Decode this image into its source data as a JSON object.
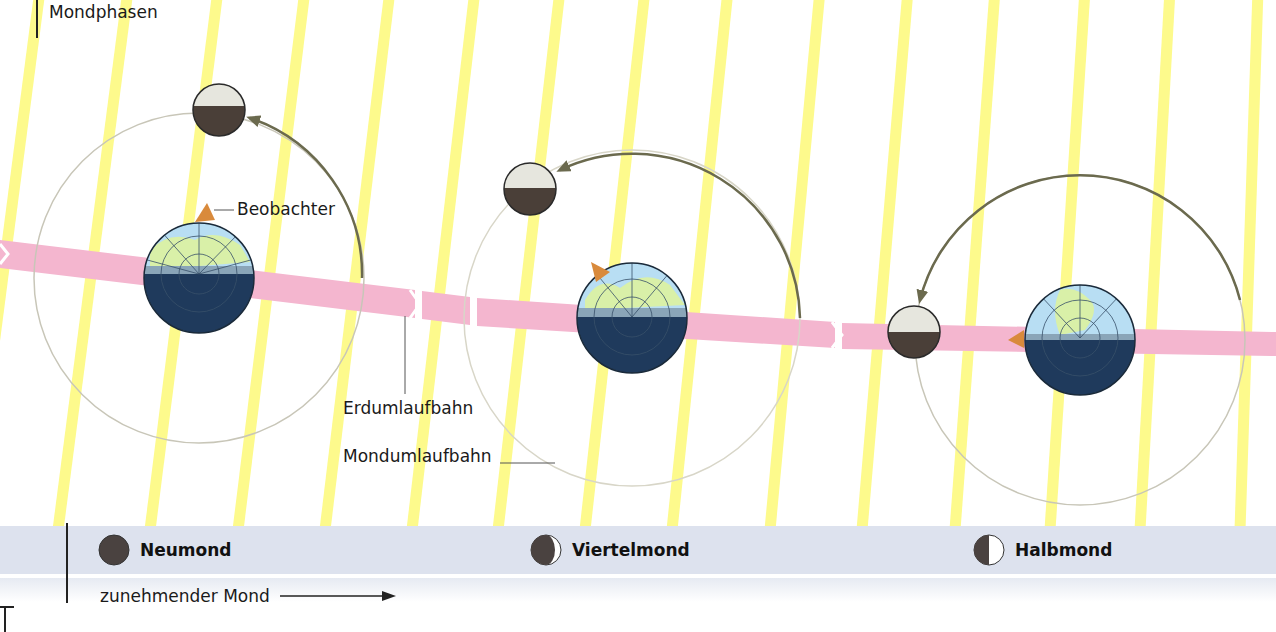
{
  "title": "Mondphasen",
  "labels": {
    "observer": "Beobachter",
    "earth_orbit": "Erdumlaufbahn",
    "moon_orbit": "Mondumlaufbahn",
    "waxing": "zunehmender Mond"
  },
  "phases": [
    {
      "name": "Neumond",
      "icon": "new-moon-icon",
      "x": 98
    },
    {
      "name": "Viertelmond",
      "icon": "crescent-moon-icon",
      "x": 530
    },
    {
      "name": "Halbmond",
      "icon": "half-moon-icon",
      "x": 973
    }
  ],
  "colors": {
    "sun_ray": "#fdfa8c",
    "earth_orbit_band": "#f4b6cf",
    "earth_ocean_day": "#b8def3",
    "earth_land_day": "#d9f0a8",
    "earth_night": "#1f3a5c",
    "moon_lit": "#e6e6de",
    "moon_dark": "#4a3f38",
    "orbit_arrow": "#6b6a4e",
    "observer": "#d98a3c",
    "phase_band": "#dde2ee"
  },
  "scene": {
    "earths": [
      {
        "cx": 199,
        "cy": 278,
        "r": 55,
        "observer_angle": -80
      },
      {
        "cx": 632,
        "cy": 318,
        "r": 55,
        "observer_angle": -130
      },
      {
        "cx": 1080,
        "cy": 340,
        "r": 55,
        "observer_angle": 180
      }
    ],
    "moons": [
      {
        "cx": 219,
        "cy": 110,
        "r": 26
      },
      {
        "cx": 530,
        "cy": 189,
        "r": 26
      },
      {
        "cx": 914,
        "cy": 332,
        "r": 26
      }
    ]
  }
}
